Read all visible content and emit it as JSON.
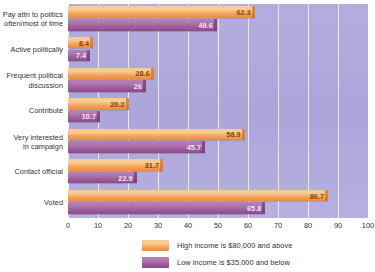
{
  "chart_data": {
    "type": "bar",
    "orientation": "horizontal",
    "title": "",
    "xlabel": "",
    "ylabel": "",
    "xlim": [
      0,
      100
    ],
    "xticks": [
      0,
      10,
      20,
      30,
      40,
      50,
      60,
      70,
      80,
      90,
      100
    ],
    "grid": true,
    "legend_position": "bottom",
    "categories": [
      "Pay attn to politics\noften/most of time",
      "Active politically",
      "Frequent political\ndiscussion",
      "Contribute",
      "Very interested\nin campaign",
      "Contact official",
      "Voted"
    ],
    "category_lines": [
      [
        "Pay attn to politics",
        "often/most of time"
      ],
      [
        "Active politically"
      ],
      [
        "Frequent political",
        "discussion"
      ],
      [
        "Contribute"
      ],
      [
        "Very interested",
        "in campaign"
      ],
      [
        "Contact official"
      ],
      [
        "Voted"
      ]
    ],
    "series": [
      {
        "name": "High income is $80,000 and above",
        "color": "#f2a košer",
        "values": [
          62.3,
          8.4,
          28.6,
          20.2,
          58.9,
          31.7,
          86.7
        ],
        "value_labels": [
          "62.3",
          "8.4",
          "28.6",
          "20.2",
          "58.9",
          "31.7",
          "86.7"
        ]
      },
      {
        "name": "Low income is $35,000 and below",
        "color": "#a0639b",
        "values": [
          49.6,
          7.4,
          26,
          10.7,
          45.7,
          22.9,
          65.8
        ],
        "value_labels": [
          "49.6",
          "7.4",
          "26",
          "10.7",
          "45.7",
          "22.9",
          "65.8"
        ]
      }
    ]
  },
  "legend": {
    "items": [
      {
        "label": "High income is $80,000 and above",
        "swatch": "high"
      },
      {
        "label": "Low income is $35,000 and below",
        "swatch": "low"
      }
    ]
  },
  "colors": {
    "high_income_bar": "#f2a košer",
    "high_income_light": "#f9cf98",
    "high_income_dark": "#ee8a3a",
    "low_income_light": "#b87fb4",
    "low_income_dark": "#8e4a89",
    "plot_background": "#b0a9dc",
    "gridline": "#ffffff",
    "text": "#2f2f35"
  }
}
